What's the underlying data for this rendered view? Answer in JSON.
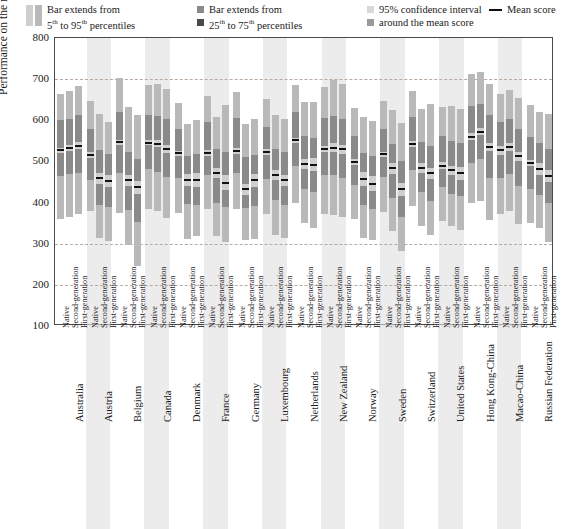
{
  "legend": {
    "items": [
      {
        "id": "p5-95",
        "line1": "Bar extends from",
        "line2_pre": "5",
        "line2_sup": "th",
        "line2_mid": " to 95",
        "line2_sup2": "th",
        "line2_post": " percentiles",
        "swatch_type": "double-tall",
        "colors": [
          "#cfcfcf",
          "#b9b9b9"
        ]
      },
      {
        "id": "p25-75",
        "line1": "Bar extends from",
        "line2_pre": "25",
        "line2_sup": "th",
        "line2_mid": " to 75",
        "line2_sup2": "th",
        "line2_post": " percentiles",
        "swatch_type": "two-small",
        "colors": [
          "#8a8a8a",
          "#4a4a4a"
        ]
      },
      {
        "id": "ci95",
        "line1": "95% confidence interval",
        "line2": "around the mean score",
        "swatch_type": "two-small",
        "colors": [
          "#d8d8d8",
          "#9a9a9a"
        ]
      },
      {
        "id": "mean",
        "line1": "Mean score",
        "swatch_type": "dash",
        "colors": [
          "#111111"
        ]
      }
    ]
  },
  "chart_data": {
    "type": "bar",
    "title": "",
    "xlabel": "",
    "ylabel": "Performance on the mathematics scale",
    "ylim": [
      100,
      800
    ],
    "yticks": [
      800,
      700,
      600,
      500,
      400,
      300,
      200,
      100
    ],
    "gridlines": [
      700,
      300,
      200
    ],
    "grid": true,
    "legend_position": "top",
    "series_names": [
      "Native",
      "Second-generation",
      "First-generation"
    ],
    "colors": {
      "p5_95": "#b9b9b9",
      "p25_75": "#8a8a8a",
      "ci": "#cfcfcf",
      "mean": "#111111",
      "band": "#e0e0e0",
      "grid": "#b9a9a0",
      "frame": "#4a4a4a"
    },
    "categories": [
      "Australia",
      "Austria",
      "Belgium",
      "Canada",
      "Denmark",
      "France",
      "Germany",
      "Luxembourg",
      "Netherlands",
      "New Zealand",
      "Norway",
      "Sweden",
      "Switzerland",
      "United States",
      "Hong Kong-China",
      "Macao-China",
      "Russian Federation"
    ],
    "shaded_categories": [
      "Austria",
      "Canada",
      "France",
      "Luxembourg",
      "New Zealand",
      "Sweden",
      "United States",
      "Macao-China"
    ],
    "bars": [
      {
        "country": "Australia",
        "gen": "Native",
        "p5": 360,
        "p95": 665,
        "p25": 465,
        "p75": 600,
        "mean": 527,
        "ci_lo": 521,
        "ci_hi": 533
      },
      {
        "country": "Australia",
        "gen": "Second-generation",
        "p5": 365,
        "p95": 672,
        "p25": 470,
        "p75": 604,
        "mean": 533,
        "ci_lo": 525,
        "ci_hi": 541
      },
      {
        "country": "Australia",
        "gen": "First-generation",
        "p5": 372,
        "p95": 683,
        "p25": 473,
        "p75": 612,
        "mean": 538,
        "ci_lo": 529,
        "ci_hi": 547
      },
      {
        "country": "Austria",
        "gen": "Native",
        "p5": 380,
        "p95": 648,
        "p25": 456,
        "p75": 578,
        "mean": 515,
        "ci_lo": 508,
        "ci_hi": 522
      },
      {
        "country": "Austria",
        "gen": "Second-generation",
        "p5": 313,
        "p95": 615,
        "p25": 395,
        "p75": 527,
        "mean": 459,
        "ci_lo": 446,
        "ci_hi": 472
      },
      {
        "country": "Austria",
        "gen": "First-generation",
        "p5": 306,
        "p95": 597,
        "p25": 390,
        "p75": 518,
        "mean": 452,
        "ci_lo": 438,
        "ci_hi": 466
      },
      {
        "country": "Belgium",
        "gen": "Native",
        "p5": 375,
        "p95": 702,
        "p25": 473,
        "p75": 620,
        "mean": 546,
        "ci_lo": 539,
        "ci_hi": 553
      },
      {
        "country": "Belgium",
        "gen": "Second-generation",
        "p5": 296,
        "p95": 632,
        "p25": 381,
        "p75": 523,
        "mean": 454,
        "ci_lo": 441,
        "ci_hi": 467
      },
      {
        "country": "Belgium",
        "gen": "First-generation",
        "p5": 247,
        "p95": 612,
        "p25": 352,
        "p75": 507,
        "mean": 437,
        "ci_lo": 421,
        "ci_hi": 453
      },
      {
        "country": "Canada",
        "gen": "Native",
        "p5": 385,
        "p95": 685,
        "p25": 482,
        "p75": 612,
        "mean": 545,
        "ci_lo": 539,
        "ci_hi": 551
      },
      {
        "country": "Canada",
        "gen": "Second-generation",
        "p5": 379,
        "p95": 687,
        "p25": 475,
        "p75": 611,
        "mean": 543,
        "ci_lo": 535,
        "ci_hi": 551
      },
      {
        "country": "Canada",
        "gen": "First-generation",
        "p5": 363,
        "p95": 677,
        "p25": 462,
        "p75": 602,
        "mean": 530,
        "ci_lo": 521,
        "ci_hi": 539
      },
      {
        "country": "Denmark",
        "gen": "Native",
        "p5": 375,
        "p95": 643,
        "p25": 460,
        "p75": 578,
        "mean": 520,
        "ci_lo": 514,
        "ci_hi": 526
      },
      {
        "country": "Denmark",
        "gen": "Second-generation",
        "p5": 311,
        "p95": 591,
        "p25": 397,
        "p75": 513,
        "mean": 455,
        "ci_lo": 441,
        "ci_hi": 469
      },
      {
        "country": "Denmark",
        "gen": "First-generation",
        "p5": 318,
        "p95": 601,
        "p25": 395,
        "p75": 518,
        "mean": 456,
        "ci_lo": 439,
        "ci_hi": 473
      },
      {
        "country": "France",
        "gen": "Native",
        "p5": 385,
        "p95": 660,
        "p25": 468,
        "p75": 595,
        "mean": 520,
        "ci_lo": 513,
        "ci_hi": 527
      },
      {
        "country": "France",
        "gen": "Second-generation",
        "p5": 318,
        "p95": 608,
        "p25": 400,
        "p75": 531,
        "mean": 472,
        "ci_lo": 459,
        "ci_hi": 485
      },
      {
        "country": "France",
        "gen": "First-generation",
        "p5": 305,
        "p95": 637,
        "p25": 390,
        "p75": 523,
        "mean": 448,
        "ci_lo": 430,
        "ci_hi": 466
      },
      {
        "country": "Germany",
        "gen": "Native",
        "p5": 385,
        "p95": 668,
        "p25": 472,
        "p75": 605,
        "mean": 525,
        "ci_lo": 518,
        "ci_hi": 532
      },
      {
        "country": "Germany",
        "gen": "Second-generation",
        "p5": 310,
        "p95": 590,
        "p25": 386,
        "p75": 510,
        "mean": 432,
        "ci_lo": 419,
        "ci_hi": 445
      },
      {
        "country": "Germany",
        "gen": "First-generation",
        "p5": 311,
        "p95": 602,
        "p25": 392,
        "p75": 515,
        "mean": 454,
        "ci_lo": 439,
        "ci_hi": 469
      },
      {
        "country": "Luxembourg",
        "gen": "Native",
        "p5": 371,
        "p95": 651,
        "p25": 457,
        "p75": 584,
        "mean": 523,
        "ci_lo": 516,
        "ci_hi": 530
      },
      {
        "country": "Luxembourg",
        "gen": "Second-generation",
        "p5": 321,
        "p95": 613,
        "p25": 405,
        "p75": 531,
        "mean": 467,
        "ci_lo": 455,
        "ci_hi": 479
      },
      {
        "country": "Luxembourg",
        "gen": "First-generation",
        "p5": 313,
        "p95": 604,
        "p25": 395,
        "p75": 523,
        "mean": 454,
        "ci_lo": 441,
        "ci_hi": 467
      },
      {
        "country": "Netherlands",
        "gen": "Native",
        "p5": 398,
        "p95": 686,
        "p25": 488,
        "p75": 620,
        "mean": 551,
        "ci_lo": 544,
        "ci_hi": 558
      },
      {
        "country": "Netherlands",
        "gen": "Second-generation",
        "p5": 350,
        "p95": 644,
        "p25": 432,
        "p75": 562,
        "mean": 494,
        "ci_lo": 481,
        "ci_hi": 507
      },
      {
        "country": "Netherlands",
        "gen": "First-generation",
        "p5": 337,
        "p95": 645,
        "p25": 425,
        "p75": 558,
        "mean": 492,
        "ci_lo": 476,
        "ci_hi": 508
      },
      {
        "country": "New Zealand",
        "gen": "Native",
        "p5": 371,
        "p95": 680,
        "p25": 467,
        "p75": 605,
        "mean": 530,
        "ci_lo": 523,
        "ci_hi": 537
      },
      {
        "country": "New Zealand",
        "gen": "Second-generation",
        "p5": 369,
        "p95": 698,
        "p25": 466,
        "p75": 610,
        "mean": 533,
        "ci_lo": 522,
        "ci_hi": 544
      },
      {
        "country": "New Zealand",
        "gen": "First-generation",
        "p5": 365,
        "p95": 688,
        "p25": 460,
        "p75": 604,
        "mean": 530,
        "ci_lo": 519,
        "ci_hi": 541
      },
      {
        "country": "Norway",
        "gen": "Native",
        "p5": 360,
        "p95": 630,
        "p25": 443,
        "p75": 562,
        "mean": 498,
        "ci_lo": 491,
        "ci_hi": 505
      },
      {
        "country": "Norway",
        "gen": "Second-generation",
        "p5": 315,
        "p95": 608,
        "p25": 394,
        "p75": 521,
        "mean": 458,
        "ci_lo": 441,
        "ci_hi": 475
      },
      {
        "country": "Norway",
        "gen": "First-generation",
        "p5": 310,
        "p95": 598,
        "p25": 385,
        "p75": 512,
        "mean": 446,
        "ci_lo": 428,
        "ci_hi": 464
      },
      {
        "country": "Sweden",
        "gen": "Native",
        "p5": 378,
        "p95": 648,
        "p25": 462,
        "p75": 580,
        "mean": 517,
        "ci_lo": 511,
        "ci_hi": 523
      },
      {
        "country": "Sweden",
        "gen": "Second-generation",
        "p5": 330,
        "p95": 625,
        "p25": 412,
        "p75": 542,
        "mean": 483,
        "ci_lo": 469,
        "ci_hi": 497
      },
      {
        "country": "Sweden",
        "gen": "First-generation",
        "p5": 283,
        "p95": 594,
        "p25": 366,
        "p75": 500,
        "mean": 432,
        "ci_lo": 417,
        "ci_hi": 447
      },
      {
        "country": "Switzerland",
        "gen": "Native",
        "p5": 392,
        "p95": 672,
        "p25": 478,
        "p75": 607,
        "mean": 543,
        "ci_lo": 536,
        "ci_hi": 550
      },
      {
        "country": "Switzerland",
        "gen": "Second-generation",
        "p5": 343,
        "p95": 628,
        "p25": 425,
        "p75": 548,
        "mean": 484,
        "ci_lo": 473,
        "ci_hi": 495
      },
      {
        "country": "Switzerland",
        "gen": "First-generation",
        "p5": 322,
        "p95": 640,
        "p25": 405,
        "p75": 537,
        "mean": 471,
        "ci_lo": 458,
        "ci_hi": 484
      },
      {
        "country": "United States",
        "gen": "Native",
        "p5": 356,
        "p95": 632,
        "p25": 438,
        "p75": 562,
        "mean": 490,
        "ci_lo": 482,
        "ci_hi": 498
      },
      {
        "country": "United States",
        "gen": "Second-generation",
        "p5": 342,
        "p95": 634,
        "p25": 422,
        "p75": 550,
        "mean": 478,
        "ci_lo": 466,
        "ci_hi": 490
      },
      {
        "country": "United States",
        "gen": "First-generation",
        "p5": 333,
        "p95": 628,
        "p25": 415,
        "p75": 545,
        "mean": 471,
        "ci_lo": 456,
        "ci_hi": 486
      },
      {
        "country": "Hong Kong-China",
        "gen": "Native",
        "p5": 398,
        "p95": 712,
        "p25": 497,
        "p75": 635,
        "mean": 560,
        "ci_lo": 551,
        "ci_hi": 569
      },
      {
        "country": "Hong Kong-China",
        "gen": "Second-generation",
        "p5": 405,
        "p95": 718,
        "p25": 505,
        "p75": 640,
        "mean": 572,
        "ci_lo": 563,
        "ci_hi": 581
      },
      {
        "country": "Hong Kong-China",
        "gen": "First-generation",
        "p5": 358,
        "p95": 688,
        "p25": 460,
        "p75": 612,
        "mean": 535,
        "ci_lo": 525,
        "ci_hi": 545
      },
      {
        "country": "Macao-China",
        "gen": "Native",
        "p5": 372,
        "p95": 664,
        "p25": 460,
        "p75": 597,
        "mean": 527,
        "ci_lo": 516,
        "ci_hi": 538
      },
      {
        "country": "Macao-China",
        "gen": "Second-generation",
        "p5": 380,
        "p95": 673,
        "p25": 470,
        "p75": 602,
        "mean": 535,
        "ci_lo": 525,
        "ci_hi": 545
      },
      {
        "country": "Macao-China",
        "gen": "First-generation",
        "p5": 348,
        "p95": 655,
        "p25": 440,
        "p75": 580,
        "mean": 512,
        "ci_lo": 502,
        "ci_hi": 522
      },
      {
        "country": "Russian Federation",
        "gen": "Native",
        "p5": 350,
        "p95": 636,
        "p25": 434,
        "p75": 560,
        "mean": 496,
        "ci_lo": 488,
        "ci_hi": 504
      },
      {
        "country": "Russian Federation",
        "gen": "Second-generation",
        "p5": 338,
        "p95": 620,
        "p25": 418,
        "p75": 545,
        "mean": 482,
        "ci_lo": 468,
        "ci_hi": 496
      },
      {
        "country": "Russian Federation",
        "gen": "First-generation",
        "p5": 305,
        "p95": 616,
        "p25": 398,
        "p75": 530,
        "mean": 465,
        "ci_lo": 450,
        "ci_hi": 480
      }
    ]
  }
}
